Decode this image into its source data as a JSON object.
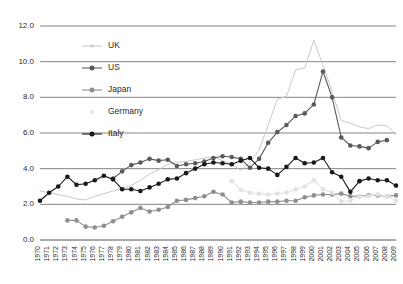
{
  "chart_data": {
    "type": "line",
    "title": "",
    "subtitle": "",
    "xlabel": "",
    "ylabel": "",
    "grid": true,
    "legend_position": "inside-top-left",
    "xlim": [
      1970,
      2009
    ],
    "ylim": [
      0.0,
      12.0
    ],
    "ytick_step": 2.0,
    "ytick_labels": [
      "0.0",
      "2.0",
      "4.0",
      "6.0",
      "8.0",
      "10.0",
      "12.0"
    ],
    "ytick_values": [
      0.0,
      2.0,
      4.0,
      6.0,
      8.0,
      10.0,
      12.0
    ],
    "categories": [
      "1970",
      "1971",
      "1972",
      "1973",
      "1974",
      "1975",
      "1976",
      "1977",
      "1978",
      "1979",
      "1980",
      "1981",
      "1982",
      "1983",
      "1984",
      "1985",
      "1986",
      "1987",
      "1988",
      "1989",
      "1990",
      "1991",
      "1992",
      "1993",
      "1994",
      "1995",
      "1996",
      "1997",
      "1998",
      "1999",
      "2000",
      "2001",
      "2002",
      "2003",
      "2004",
      "2005",
      "2006",
      "2007",
      "2008",
      "2009"
    ],
    "series": [
      {
        "name": "UK",
        "color": "#c9c9c9",
        "marker": "none",
        "values": [
          2.75,
          2.65,
          2.55,
          2.45,
          2.3,
          2.25,
          2.45,
          2.6,
          2.75,
          2.9,
          3.05,
          3.35,
          3.7,
          3.95,
          4.25,
          4.35,
          4.4,
          4.5,
          4.6,
          4.65,
          4.45,
          4.25,
          3.9,
          4.35,
          5.05,
          6.45,
          7.9,
          8.05,
          9.55,
          9.65,
          11.2,
          9.8,
          8.3,
          6.7,
          6.55,
          6.35,
          6.25,
          6.45,
          6.4,
          5.9
        ]
      },
      {
        "name": "US",
        "color": "#5a5a5a",
        "marker": "circle",
        "values": [
          null,
          null,
          null,
          null,
          null,
          null,
          null,
          null,
          3.45,
          3.85,
          4.2,
          4.35,
          4.55,
          4.45,
          4.5,
          4.15,
          4.25,
          4.3,
          4.4,
          4.6,
          4.7,
          4.65,
          4.55,
          4.05,
          4.55,
          5.45,
          6.05,
          6.45,
          6.95,
          7.1,
          7.6,
          9.45,
          8.0,
          5.75,
          5.3,
          5.25,
          5.15,
          5.5,
          5.6,
          null
        ]
      },
      {
        "name": "Japan",
        "color": "#8f8f8f",
        "marker": "circle",
        "values": [
          null,
          null,
          null,
          1.1,
          1.1,
          0.75,
          0.7,
          0.8,
          1.05,
          1.3,
          1.55,
          1.8,
          1.6,
          1.7,
          1.85,
          2.2,
          2.25,
          2.35,
          2.45,
          2.7,
          2.55,
          2.1,
          2.15,
          2.1,
          2.1,
          2.15,
          2.15,
          2.2,
          2.2,
          2.4,
          2.5,
          2.55,
          2.55,
          2.6,
          2.45,
          2.45,
          2.5,
          2.5,
          2.45,
          2.5
        ]
      },
      {
        "name": "Germany",
        "color": "#e2e2e2",
        "marker": "circle",
        "values": [
          null,
          null,
          null,
          null,
          null,
          null,
          null,
          null,
          null,
          null,
          null,
          null,
          null,
          null,
          null,
          null,
          null,
          null,
          null,
          null,
          null,
          3.3,
          2.8,
          2.65,
          2.6,
          2.55,
          2.6,
          2.65,
          2.85,
          3.0,
          3.35,
          2.85,
          2.65,
          2.15,
          2.2,
          2.45,
          2.45,
          2.55,
          2.45,
          2.2
        ]
      },
      {
        "name": "Italy",
        "color": "#1a1a1a",
        "marker": "circle",
        "values": [
          2.2,
          2.65,
          3.0,
          3.55,
          3.1,
          3.15,
          3.35,
          3.6,
          3.4,
          2.85,
          2.85,
          2.75,
          2.95,
          3.15,
          3.4,
          3.45,
          3.75,
          4.0,
          4.25,
          4.35,
          4.3,
          4.25,
          4.45,
          4.6,
          4.05,
          4.0,
          3.65,
          4.1,
          4.6,
          4.3,
          4.35,
          4.6,
          3.8,
          3.55,
          2.7,
          3.3,
          3.45,
          3.35,
          3.35,
          3.05
        ]
      }
    ]
  },
  "legend": {
    "items": [
      {
        "label": "UK",
        "color": "#c9c9c9",
        "marker": "none"
      },
      {
        "label": "US",
        "color": "#5a5a5a",
        "marker": "circle"
      },
      {
        "label": "Japan",
        "color": "#8f8f8f",
        "marker": "circle"
      },
      {
        "label": "Germany",
        "color": "#e2e2e2",
        "marker": "dot"
      },
      {
        "label": "Italy",
        "color": "#1a1a1a",
        "marker": "circle"
      }
    ]
  }
}
